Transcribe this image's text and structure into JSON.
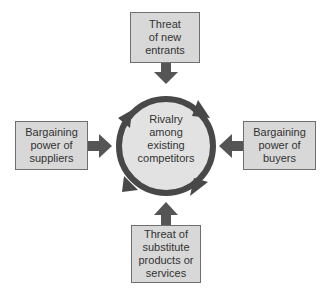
{
  "diagram": {
    "center": {
      "lines": [
        "Rivalry",
        "among",
        "existing",
        "competitors"
      ]
    },
    "forces": {
      "top": {
        "lines": [
          "Threat",
          "of new",
          "entrants"
        ]
      },
      "left": {
        "lines": [
          "Bargaining",
          "power of",
          "suppliers"
        ]
      },
      "right": {
        "lines": [
          "Bargaining",
          "power of",
          "buyers"
        ]
      },
      "bottom": {
        "lines": [
          "Threat of",
          "substitute",
          "products or",
          "services"
        ]
      }
    },
    "colors": {
      "box_fill": "#d8d8d8",
      "box_border": "#6e6e6e",
      "arrow": "#555555",
      "circle_fill": "#e2e2e2",
      "ring": "#444444"
    }
  }
}
